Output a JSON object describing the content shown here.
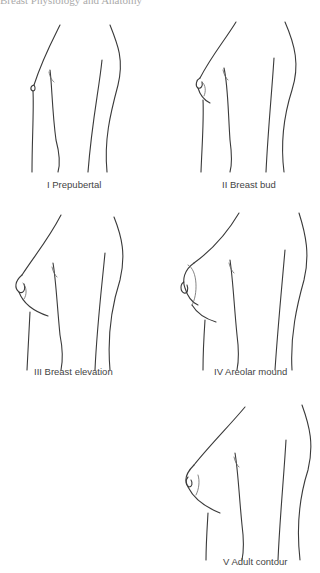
{
  "header": {
    "text": "Breast Physiology and Anatomy"
  },
  "figure": {
    "stages": [
      {
        "numeral": "I",
        "label": "I Prepubertal"
      },
      {
        "numeral": "II",
        "label": "II Breast bud"
      },
      {
        "numeral": "III",
        "label": "III Breast elevation"
      },
      {
        "numeral": "IV",
        "label": "IV Areolar mound"
      },
      {
        "numeral": "V",
        "label": "V Adult contour"
      }
    ]
  },
  "colors": {
    "line": "#3a3a3a",
    "label": "#444444",
    "background": "#ffffff"
  }
}
